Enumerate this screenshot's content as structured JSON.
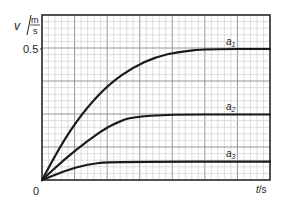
{
  "chart_data": {
    "type": "line",
    "title": "",
    "xlabel": "t/s",
    "ylabel": "v / (m/s)",
    "ylabel_parts": {
      "symbol": "v",
      "num": "m",
      "den": "s"
    },
    "xlabel_parts": {
      "symbol": "t",
      "unit": "/s"
    },
    "origin_label": "0",
    "y_ticks": [
      {
        "value": 0.5,
        "label": "0.5"
      }
    ],
    "ylim": [
      0,
      0.63
    ],
    "xlim": [
      0,
      1
    ],
    "grid": true,
    "legend": "inline labels at right",
    "series": [
      {
        "name": "a1",
        "label_main": "a",
        "label_sub": "1",
        "plateau": 0.5,
        "plateau_x": 0.72,
        "points": [
          [
            0,
            0
          ],
          [
            0.1,
            0.16
          ],
          [
            0.2,
            0.28
          ],
          [
            0.3,
            0.37
          ],
          [
            0.4,
            0.43
          ],
          [
            0.5,
            0.47
          ],
          [
            0.6,
            0.49
          ],
          [
            0.72,
            0.5
          ],
          [
            1.0,
            0.5
          ]
        ]
      },
      {
        "name": "a2",
        "label_main": "a",
        "label_sub": "2",
        "plateau": 0.25,
        "plateau_x": 0.42,
        "points": [
          [
            0,
            0
          ],
          [
            0.1,
            0.08
          ],
          [
            0.2,
            0.15
          ],
          [
            0.3,
            0.21
          ],
          [
            0.42,
            0.25
          ],
          [
            1.0,
            0.25
          ]
        ]
      },
      {
        "name": "a3",
        "label_main": "a",
        "label_sub": "3",
        "plateau": 0.07,
        "plateau_x": 0.3,
        "points": [
          [
            0,
            0
          ],
          [
            0.1,
            0.035
          ],
          [
            0.2,
            0.06
          ],
          [
            0.3,
            0.07
          ],
          [
            1.0,
            0.07
          ]
        ]
      }
    ]
  },
  "colors": {
    "grid_minor": "#c8c8c8",
    "grid_major": "#8a8a8a",
    "curve": "#1a1a1a",
    "axis": "#333333"
  }
}
